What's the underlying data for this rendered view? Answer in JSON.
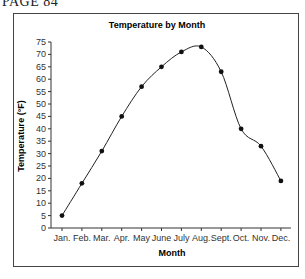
{
  "page_header": "PAGE 84",
  "chart_data": {
    "type": "line",
    "title": "Temperature by Month",
    "xlabel": "Month",
    "ylabel": "Temperature (°F)",
    "categories": [
      "Jan.",
      "Feb.",
      "Mar.",
      "Apr.",
      "May",
      "June",
      "July",
      "Aug.",
      "Sept.",
      "Oct.",
      "Nov.",
      "Dec."
    ],
    "series": [
      {
        "name": "Temperature",
        "values": [
          5,
          18,
          31,
          45,
          57,
          65,
          71,
          73,
          63,
          40,
          33,
          19
        ]
      }
    ],
    "ylim": [
      0,
      75
    ],
    "yticks": [
      0,
      5,
      10,
      15,
      20,
      25,
      30,
      35,
      40,
      45,
      50,
      55,
      60,
      65,
      70,
      75
    ],
    "grid": false,
    "legend": "none",
    "line_style": "smooth",
    "marker": "filled-circle"
  }
}
